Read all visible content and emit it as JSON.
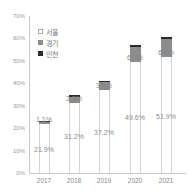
{
  "chart_data": {
    "type": "bar",
    "stacked": true,
    "title": "",
    "xlabel": "",
    "ylabel": "",
    "categories": [
      "2017",
      "2018",
      "2019",
      "2020",
      "2021"
    ],
    "series": [
      {
        "name": "서울",
        "color": "#ffffff",
        "values": [
          21.9,
          31.2,
          37.2,
          49.6,
          51.9
        ]
      },
      {
        "name": "경기",
        "color": "#8c8c8c",
        "values": [
          1.1,
          2.9,
          3.4,
          6.5,
          7.8
        ]
      },
      {
        "name": "인천",
        "color": "#2a2a2a",
        "values": [
          0.4,
          0.5,
          0.6,
          1.0,
          0.9
        ]
      }
    ],
    "data_labels": {
      "seoul": [
        "21.9%",
        "31.2%",
        "37.2%",
        "49.6%",
        "51.9%"
      ],
      "gyeonggi": [
        "1.1%",
        "2.9%",
        "3.4%",
        "6.5%",
        "6.8%"
      ]
    },
    "yticks": [
      "0%",
      "10%",
      "20%",
      "30%",
      "40%",
      "50%",
      "60%",
      "70%"
    ],
    "ylim": [
      0,
      70
    ],
    "grid": false,
    "legend_position": "top-left inside"
  },
  "legend": [
    {
      "label": "서울",
      "color": "#ffffff"
    },
    {
      "label": "경기",
      "color": "#8c8c8c"
    },
    {
      "label": "인천",
      "color": "#2a2a2a"
    }
  ]
}
